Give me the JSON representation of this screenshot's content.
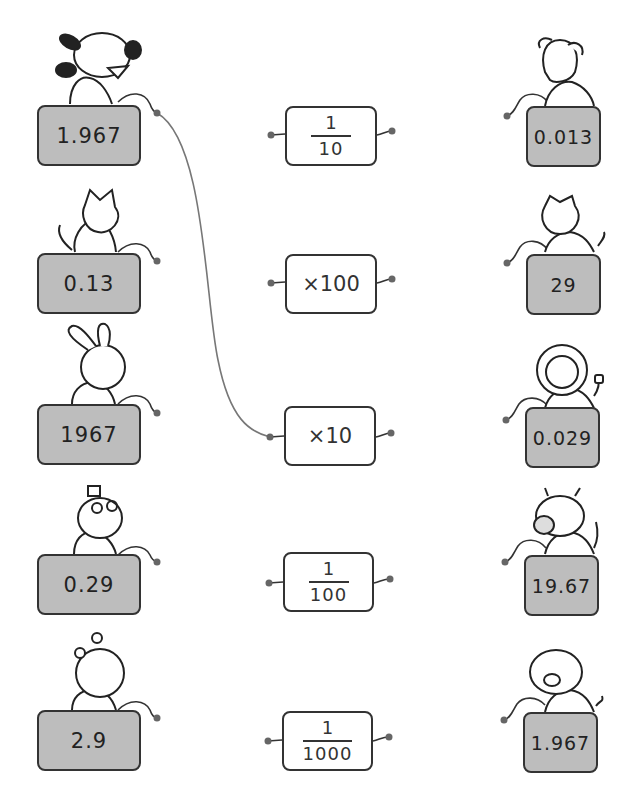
{
  "colors": {
    "card_fill": "#bdbdbd",
    "operator_fill": "#ffffff",
    "stroke": "#333333",
    "wire": "#777777",
    "dot": "#666666"
  },
  "left_column": [
    {
      "value": "1.967",
      "animal": "dog"
    },
    {
      "value": "0.13",
      "animal": "cat"
    },
    {
      "value": "1967",
      "animal": "rabbit"
    },
    {
      "value": "0.29",
      "animal": "mouse"
    },
    {
      "value": "2.9",
      "animal": "bear"
    }
  ],
  "middle_column": [
    {
      "type": "fraction",
      "numerator": "1",
      "denominator": "10"
    },
    {
      "type": "text",
      "label": "×100"
    },
    {
      "type": "text",
      "label": "×10"
    },
    {
      "type": "fraction",
      "numerator": "1",
      "denominator": "100"
    },
    {
      "type": "fraction",
      "numerator": "1",
      "denominator": "1000"
    }
  ],
  "right_column": [
    {
      "value": "0.013",
      "animal": "puppy"
    },
    {
      "value": "29",
      "animal": "cat"
    },
    {
      "value": "0.029",
      "animal": "lion"
    },
    {
      "value": "19.67",
      "animal": "cow"
    },
    {
      "value": "1.967",
      "animal": "pig"
    }
  ],
  "connections": [
    {
      "from": "left.0",
      "to": "middle.2"
    }
  ]
}
